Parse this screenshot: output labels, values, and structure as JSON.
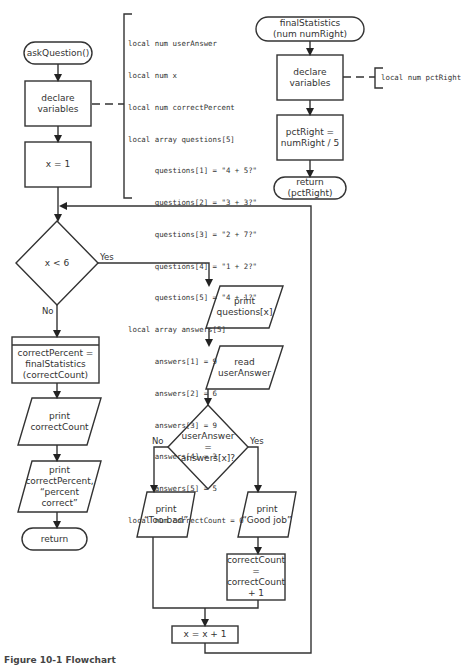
{
  "diagram": {
    "type": "flowchart",
    "main_module": {
      "start": "askQuestion()",
      "declare": "declare\nvariables",
      "init": "x = 1",
      "loop_condition": "x < 6",
      "yes_label": "Yes",
      "no_label": "No",
      "call": "correctPercent =\nfinalStatistics\n(correctCount)",
      "print_count": "print\ncorrectCount",
      "print_percent": "print\ncorrectPercent,\n“percent\ncorrect”",
      "end": "return",
      "print_question": "print\nquestions[x]",
      "read_answer": "read\nuserAnswer",
      "answer_condition": "userAnswer\n=\nanswers[x]?",
      "answer_no_label": "No",
      "answer_yes_label": "Yes",
      "print_bad": "print\n“Too bad”",
      "print_good": "print\n“Good job”",
      "increment_count": "correctCount\n=\ncorrectCount\n+ 1",
      "increment_x": "x = x + 1"
    },
    "declarations": [
      "local num userAnswer",
      "local num x",
      "local num correctPercent",
      "local array questions[5]",
      "      questions[1] = \"4 + 5?\"",
      "      questions[2] = \"3 + 3?\"",
      "      questions[3] = \"2 + 7?\"",
      "      questions[4] = \"1 + 2?\"",
      "      questions[5] = \"4 + 1?\"",
      "local array answers[5]",
      "      answers[1] = 9",
      "      answers[2] = 6",
      "      answers[3] = 9",
      "      answers[4] = 3",
      "      answers[5] = 5",
      "local num correctCount = 0"
    ],
    "stats_module": {
      "start": "finalStatistics\n(num numRight)",
      "declare": "declare\nvariables",
      "declaration": "local num pctRight",
      "compute": "pctRight =\nnumRight / 5",
      "end": "return\n(pctRight)"
    },
    "caption": "Figure 10-1  Flowchart"
  }
}
